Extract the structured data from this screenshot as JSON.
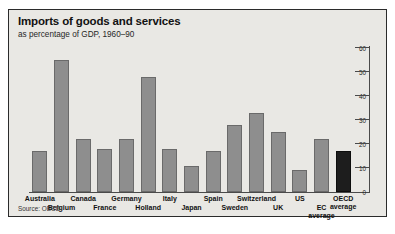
{
  "chart_data": {
    "type": "bar",
    "title": "Imports of goods and services",
    "subtitle": "as percentage of GDP, 1960–90",
    "xlabel": "",
    "ylabel": "",
    "ylim": [
      0,
      60
    ],
    "yticks": [
      0,
      10,
      20,
      30,
      40,
      50,
      60
    ],
    "grid": false,
    "legend": false,
    "axis_position": "right",
    "source": "Source: OECD",
    "categories": [
      "Australia",
      "Belgium",
      "Canada",
      "France",
      "Germany",
      "Holland",
      "Italy",
      "Japan",
      "Spain",
      "Sweden",
      "Switzerland",
      "UK",
      "US",
      "EC average",
      "OECD average"
    ],
    "values": [
      17,
      55,
      22,
      18,
      22,
      48,
      18,
      11,
      17,
      28,
      33,
      25,
      9,
      22,
      17
    ],
    "bars": [
      {
        "label": "Australia",
        "label_line1": "Australia",
        "label_line2": "",
        "value": 17,
        "row": 0,
        "highlight": false
      },
      {
        "label": "Belgium",
        "label_line1": "Belgium",
        "label_line2": "",
        "value": 55,
        "row": 1,
        "highlight": false
      },
      {
        "label": "Canada",
        "label_line1": "Canada",
        "label_line2": "",
        "value": 22,
        "row": 0,
        "highlight": false
      },
      {
        "label": "France",
        "label_line1": "France",
        "label_line2": "",
        "value": 18,
        "row": 1,
        "highlight": false
      },
      {
        "label": "Germany",
        "label_line1": "Germany",
        "label_line2": "",
        "value": 22,
        "row": 0,
        "highlight": false
      },
      {
        "label": "Holland",
        "label_line1": "Holland",
        "label_line2": "",
        "value": 48,
        "row": 1,
        "highlight": false
      },
      {
        "label": "Italy",
        "label_line1": "Italy",
        "label_line2": "",
        "value": 18,
        "row": 0,
        "highlight": false
      },
      {
        "label": "Japan",
        "label_line1": "Japan",
        "label_line2": "",
        "value": 11,
        "row": 1,
        "highlight": false
      },
      {
        "label": "Spain",
        "label_line1": "Spain",
        "label_line2": "",
        "value": 17,
        "row": 0,
        "highlight": false
      },
      {
        "label": "Sweden",
        "label_line1": "Sweden",
        "label_line2": "",
        "value": 28,
        "row": 1,
        "highlight": false
      },
      {
        "label": "Switzerland",
        "label_line1": "Switzerland",
        "label_line2": "",
        "value": 33,
        "row": 0,
        "highlight": false
      },
      {
        "label": "UK",
        "label_line1": "UK",
        "label_line2": "",
        "value": 25,
        "row": 1,
        "highlight": false
      },
      {
        "label": "US",
        "label_line1": "US",
        "label_line2": "",
        "value": 9,
        "row": 0,
        "highlight": false
      },
      {
        "label": "EC average",
        "label_line1": "EC",
        "label_line2": "average",
        "value": 22,
        "row": 1,
        "highlight": false
      },
      {
        "label": "OECD average",
        "label_line1": "OECD",
        "label_line2": "average",
        "value": 17,
        "row": 0,
        "highlight": true
      }
    ],
    "colors": {
      "bar": "#8e8e8e",
      "bar_highlight": "#1d1d1d",
      "panel_background": "#e9e8e4",
      "panel_border": "#2b2b2b",
      "axis": "#4a4a4a",
      "text": "#111111"
    }
  }
}
